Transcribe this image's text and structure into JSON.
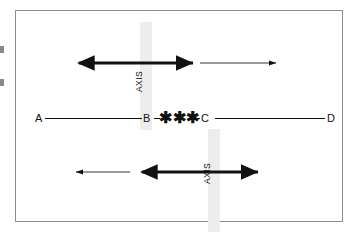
{
  "figure": {
    "frame": {
      "border_color": "#8c8c8c",
      "background_color": "#ffffff"
    },
    "axis_bands": [
      {
        "id": "upper",
        "label": "AXIS",
        "color": "#ededed",
        "orientation": "vertical",
        "position": "above-center-line"
      },
      {
        "id": "lower",
        "label": "AXIS",
        "color": "#ededed",
        "orientation": "vertical",
        "position": "below-center-line"
      }
    ],
    "center_line": {
      "stroke_color": "#111111",
      "nodes": [
        {
          "id": "a",
          "label": "A"
        },
        {
          "id": "b",
          "label": "B"
        },
        {
          "id": "c",
          "label": "C"
        },
        {
          "id": "d",
          "label": "D"
        }
      ],
      "break_symbol": "✱✱✱"
    },
    "arrows": {
      "upper": [
        {
          "id": "upper-thick",
          "style": "thick",
          "heads": "double",
          "direction": "both",
          "color": "#111111"
        },
        {
          "id": "upper-thin",
          "style": "thin",
          "heads": "single",
          "direction": "right",
          "color": "#111111"
        }
      ],
      "lower": [
        {
          "id": "lower-thin",
          "style": "thin",
          "heads": "single",
          "direction": "left",
          "color": "#111111"
        },
        {
          "id": "lower-thick",
          "style": "thick",
          "heads": "double",
          "direction": "both",
          "color": "#111111"
        }
      ]
    },
    "edge_marks": [
      {
        "id": "top",
        "color": "#5a5a5a"
      },
      {
        "id": "bottom",
        "color": "#5a5a5a"
      }
    ]
  }
}
